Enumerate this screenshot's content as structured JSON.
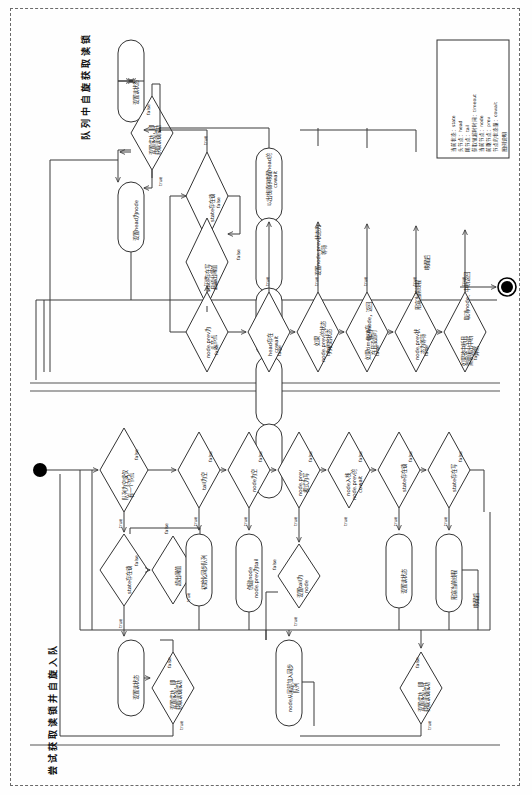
{
  "diagram": {
    "kind": "flowchart",
    "orientation": "rotated-90-ccw",
    "titles": {
      "upper_swimlane": "队列中自旋获取读锁",
      "lower_swimlane": "尝试获取读锁并自旋入队"
    },
    "legend": {
      "title": "图例说明",
      "entries": [
        "当前状态：state",
        "头节点：head",
        "尾节点：tail",
        "获取锁超时时间：timeout",
        "当前节点：node",
        "前驱节点：prev",
        "节点的状态量：cowait"
      ]
    },
    "edge_labels": {
      "yes": "true",
      "no": "false"
    },
    "upper_nodes": [
      {
        "id": "u_set_read_state",
        "type": "process",
        "label": "设置读状态"
      },
      {
        "id": "u_set_ok",
        "type": "decision",
        "label": "设置成功，即\n获取读锁成功"
      },
      {
        "id": "u_set_head",
        "type": "process",
        "label": "设置head为node"
      },
      {
        "id": "u_state_lock",
        "type": "decision",
        "label": "state存在锁"
      },
      {
        "id": "u_state_write_over",
        "type": "decision",
        "label": "state存在写\n且超出阈值"
      },
      {
        "id": "u_prev_is_head",
        "type": "decision",
        "label": "node.prev为\n头节点"
      },
      {
        "id": "u_head_cowait",
        "type": "decision",
        "label": "head存在\ncowait"
      },
      {
        "id": "u_pop_cowait",
        "type": "process",
        "label": "以出栈顺序唤醒head的\ncowait"
      },
      {
        "id": "u_prev_init",
        "type": "decision",
        "label": "如果\nnode.prev的状态\n为初始状态"
      },
      {
        "id": "u_set_prev_wait",
        "type": "process",
        "label": "设置node.prev状态为\n等待"
      },
      {
        "id": "u_timeout_ok",
        "type": "decision",
        "label": "如果timeout存\n在且没超时"
      },
      {
        "id": "u_cancel_return",
        "type": "process",
        "label": "取消node，返回"
      },
      {
        "id": "u_prev_waiting",
        "type": "decision",
        "label": "node.prev状\n态为等待"
      },
      {
        "id": "u_park",
        "type": "process",
        "label": "阻塞当前线程"
      },
      {
        "id": "u_interrupted",
        "type": "decision",
        "label": "如果被中断且\n需要抛出中断\n异常"
      },
      {
        "id": "u_cancel_interrupt",
        "type": "process",
        "label": "取消node、中断返回"
      }
    ],
    "upper_park_note": "唤醒后",
    "lower_nodes": [
      {
        "id": "l_queue_empty",
        "type": "decision",
        "label": "队列为空或仅\n有一个节点"
      },
      {
        "id": "l_state_lock",
        "type": "decision",
        "label": "state存在锁"
      },
      {
        "id": "l_over_limit",
        "type": "decision",
        "label": "超出阈值"
      },
      {
        "id": "l_set_read_state",
        "type": "process",
        "label": "设置读状态"
      },
      {
        "id": "l_set_ok",
        "type": "decision",
        "label": "设置成功，即\n获取读锁成功"
      },
      {
        "id": "l_tail_null",
        "type": "decision",
        "label": "tail为空"
      },
      {
        "id": "l_init_queue",
        "type": "process",
        "label": "初始化同步队列"
      },
      {
        "id": "l_node_null",
        "type": "decision",
        "label": "node为空"
      },
      {
        "id": "l_create_node",
        "type": "process",
        "label": "创建node\nnode.prev为tail"
      },
      {
        "id": "l_prev_write",
        "type": "decision",
        "label": "node.prev\n模式为写"
      },
      {
        "id": "l_set_tail",
        "type": "decision",
        "label": "设置tail为\nnode"
      },
      {
        "id": "l_push_cowait",
        "type": "decision",
        "label": "node入栈\nnode.prev的\ncowait"
      },
      {
        "id": "l_state_lock2",
        "type": "decision",
        "label": "state存在锁"
      },
      {
        "id": "l_set_read_state2",
        "type": "process",
        "label": "设置读状态"
      },
      {
        "id": "l_state_write",
        "type": "decision",
        "label": "state存在写"
      },
      {
        "id": "l_park",
        "type": "process",
        "label": "阻塞当前线程"
      },
      {
        "id": "l_enqueue_tail",
        "type": "process",
        "label": "node从尾部加入同步\n队列"
      },
      {
        "id": "l_set_ok2",
        "type": "decision",
        "label": "设置成功，即\n获取读锁成功"
      }
    ],
    "lower_park_note": "唤醒后",
    "terminals": {
      "start": "start-node",
      "end": "end-node"
    },
    "colors": {
      "stroke": "#333333",
      "fill": "#ffffff",
      "dash": "#666666",
      "text": "#111111"
    }
  }
}
